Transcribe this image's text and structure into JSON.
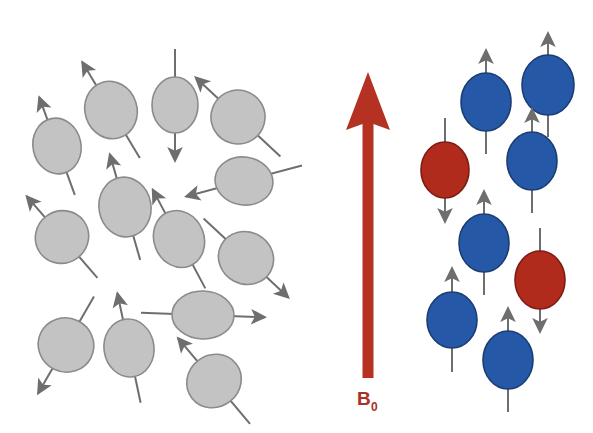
{
  "figure": {
    "width": 593,
    "height": 433,
    "background": "#ffffff"
  },
  "colors": {
    "gray_fill": "#c3c3c3",
    "gray_stroke": "#8b8b8b",
    "blue_fill": "#2559a8",
    "blue_stroke": "#1b3d73",
    "red_fill": "#b02b1c",
    "red_stroke": "#7d1c12",
    "arrow_stroke": "#6e6e6e",
    "field_arrow": "#b53222",
    "field_label": "#a83228"
  },
  "field": {
    "label_main": "B",
    "label_sub": "0",
    "direction": "up",
    "arrow": {
      "x": 368,
      "tip_y": 72,
      "tail_y": 378,
      "shaft_width": 11,
      "head_width": 44,
      "head_height": 58
    }
  },
  "left_panel": {
    "name": "random-spins",
    "caption": "",
    "spin_count": 14,
    "color": "gray",
    "spins": [
      {
        "cx": 57,
        "cy": 146,
        "rx": 24,
        "ry": 28,
        "rot": -12,
        "angle": 200,
        "len": 52,
        "arrow_rot": -20
      },
      {
        "cx": 111,
        "cy": 110,
        "rx": 26,
        "ry": 29,
        "rot": -18,
        "angle": 210,
        "len": 56,
        "arrow_rot": -31
      },
      {
        "cx": 175,
        "cy": 105,
        "rx": 23,
        "ry": 28,
        "rot": 0,
        "angle": 180,
        "len": 56,
        "arrow_rot": 180
      },
      {
        "cx": 238,
        "cy": 117,
        "rx": 27,
        "ry": 27,
        "rot": -30,
        "angle": 215,
        "len": 58,
        "arrow_rot": -47
      },
      {
        "cx": 125,
        "cy": 207,
        "rx": 26,
        "ry": 30,
        "rot": -10,
        "angle": 205,
        "len": 55,
        "arrow_rot": -16
      },
      {
        "cx": 244,
        "cy": 181,
        "rx": 29,
        "ry": 24,
        "rot": 8,
        "angle": 250,
        "len": 60,
        "arrow_rot": -105
      },
      {
        "cx": 62,
        "cy": 237,
        "rx": 27,
        "ry": 26,
        "rot": -36,
        "angle": 225,
        "len": 54,
        "arrow_rot": -41
      },
      {
        "cx": 179,
        "cy": 239,
        "rx": 25,
        "ry": 29,
        "rot": -22,
        "angle": 210,
        "len": 56,
        "arrow_rot": -28
      },
      {
        "cx": 246,
        "cy": 258,
        "rx": 28,
        "ry": 26,
        "rot": 28,
        "angle": 140,
        "len": 58,
        "arrow_rot": 133
      },
      {
        "cx": 203,
        "cy": 315,
        "rx": 31,
        "ry": 24,
        "rot": 2,
        "angle": 95,
        "len": 62,
        "arrow_rot": 92
      },
      {
        "cx": 66,
        "cy": 345,
        "rx": 28,
        "ry": 27,
        "rot": 26,
        "angle": 200,
        "len": 56,
        "arrow_rot": 210
      },
      {
        "cx": 129,
        "cy": 348,
        "rx": 25,
        "ry": 29,
        "rot": -8,
        "angle": 195,
        "len": 56,
        "arrow_rot": -12
      },
      {
        "cx": 214,
        "cy": 381,
        "rx": 28,
        "ry": 26,
        "rot": -38,
        "angle": 220,
        "len": 56,
        "arrow_rot": -40
      },
      {
        "cx": 112,
        "cy": 287,
        "rx": 0,
        "ry": 0,
        "rot": 0,
        "angle": 0,
        "len": 0,
        "arrow_rot": 0
      }
    ]
  },
  "right_panel": {
    "name": "aligned-spins",
    "caption": "",
    "spin_count": 8,
    "up_count": 6,
    "down_count": 2,
    "spins": [
      {
        "cx": 486,
        "cy": 102,
        "rx": 25,
        "ry": 29,
        "state": "up",
        "color": "blue"
      },
      {
        "cx": 548,
        "cy": 85,
        "rx": 26,
        "ry": 30,
        "state": "up",
        "color": "blue"
      },
      {
        "cx": 445,
        "cy": 170,
        "rx": 24,
        "ry": 28,
        "state": "down",
        "color": "red"
      },
      {
        "cx": 532,
        "cy": 161,
        "rx": 25,
        "ry": 29,
        "state": "up",
        "color": "blue"
      },
      {
        "cx": 484,
        "cy": 243,
        "rx": 25,
        "ry": 29,
        "state": "up",
        "color": "blue"
      },
      {
        "cx": 540,
        "cy": 280,
        "rx": 25,
        "ry": 29,
        "state": "down",
        "color": "red"
      },
      {
        "cx": 452,
        "cy": 320,
        "rx": 25,
        "ry": 28,
        "state": "up",
        "color": "blue"
      },
      {
        "cx": 508,
        "cy": 360,
        "rx": 25,
        "ry": 29,
        "state": "up",
        "color": "blue"
      }
    ]
  }
}
